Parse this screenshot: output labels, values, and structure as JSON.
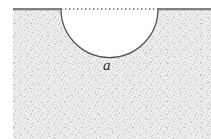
{
  "figure": {
    "caption_label": "a",
    "label_meaning": "radius-of-semicircular-notch",
    "background_color": "#ffffff",
    "hatch_fill_color": "#e8e8e8",
    "hatch_speckle_color": "#c9c9c9",
    "outline_color": "#4a4a4a",
    "surface_line_color": "#555555",
    "dotted_line_color": "#6b6b6b",
    "label_color": "#2b2b2b"
  },
  "geometry": {
    "canvas_width": 211,
    "canvas_height": 139,
    "solid_left_x": 13,
    "solid_right_x": 211,
    "surface_y": 9,
    "notch_left_x": 61,
    "notch_right_x": 158,
    "notch_center_x": 109.5,
    "notch_radius": 48.5,
    "notch_bottom_y": 86,
    "label_x": 103,
    "label_y": 60
  },
  "elements": {
    "left_surface_label": "left free surface line",
    "right_surface_label": "right free surface line",
    "dotted_span_label": "dotted datum line across notch opening",
    "notch_arc_label": "semicircular notch boundary",
    "hatched_body_label": "hatched solid body"
  }
}
